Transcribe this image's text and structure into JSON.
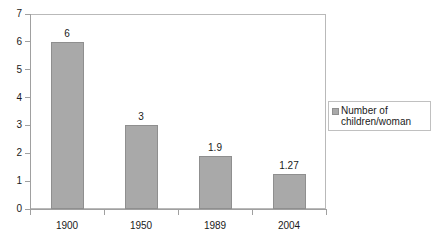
{
  "chart_data": {
    "type": "bar",
    "title": "",
    "xlabel": "",
    "ylabel": "",
    "categories": [
      "1900",
      "1950",
      "1989",
      "2004"
    ],
    "values": [
      6,
      3,
      1.9,
      1.27
    ],
    "value_labels": [
      "6",
      "3",
      "1.9",
      "1.27"
    ],
    "series": [
      {
        "name": "Number of children/woman",
        "values": [
          6,
          3,
          1.9,
          1.27
        ],
        "color": "#a9a9a9"
      }
    ],
    "ylim": [
      0,
      7
    ],
    "ytick_labels": [
      "0",
      "1",
      "2",
      "3",
      "4",
      "5",
      "6",
      "7"
    ],
    "ytick_values": [
      0,
      1,
      2,
      3,
      4,
      5,
      6,
      7
    ],
    "grid": false,
    "legend_position": "right",
    "legend_entries": [
      {
        "label_line1": "Number of",
        "label_line2": "children/woman",
        "color": "#a9a9a9"
      }
    ],
    "plot_border_color": "#b9b9b9",
    "axis_color": "#a0a0a0",
    "background": "#ffffff"
  }
}
